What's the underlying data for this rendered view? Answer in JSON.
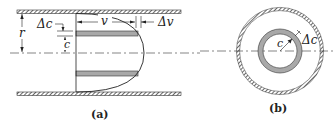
{
  "figure": {
    "panel_a": {
      "caption": "(a)",
      "labels": {
        "radius": "r",
        "delta_c": "Δc",
        "c": "c",
        "velocity": "v",
        "delta_v": "Δv"
      },
      "description": "Pipe longitudinal section with parabolic velocity profile and shaded annular shell"
    },
    "panel_b": {
      "caption": "(b)",
      "labels": {
        "c": "c",
        "delta_c": "Δc"
      },
      "description": "Pipe cross-section showing annular ring of radius c and thickness Δc"
    },
    "colors": {
      "wall_hatch": "#555555",
      "line": "#222222",
      "shell_fill": "#a8a8a8",
      "background": "#ffffff"
    }
  }
}
